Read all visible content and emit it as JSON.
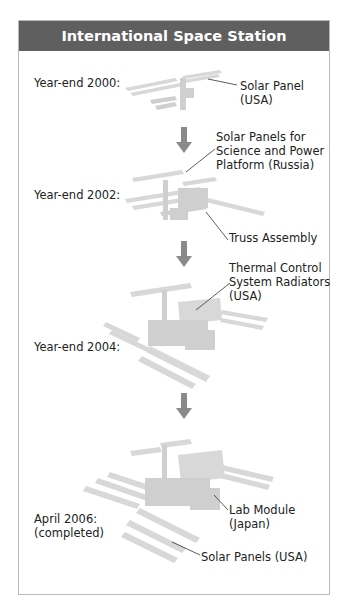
{
  "title": "International Space Station",
  "stages": [
    {
      "label": "Year-end 2000:"
    },
    {
      "label": "Year-end 2002:"
    },
    {
      "label": "Year-end 2004:"
    },
    {
      "label": "April 2006:\n(completed)"
    }
  ],
  "callouts": [
    {
      "text": "Solar Panel\n(USA)"
    },
    {
      "text": "Solar Panels for\nScience and Power\nPlatform (Russia)"
    },
    {
      "text": "Truss Assembly"
    },
    {
      "text": "Thermal Control\nSystem Radiators\n(USA)"
    },
    {
      "text": "Lab Module\n(Japan)"
    },
    {
      "text": "Solar Panels (USA)"
    }
  ],
  "colors": {
    "header": "#5f5f5f",
    "arrow": "#8a8a8a",
    "station": "#d4d4d4"
  }
}
